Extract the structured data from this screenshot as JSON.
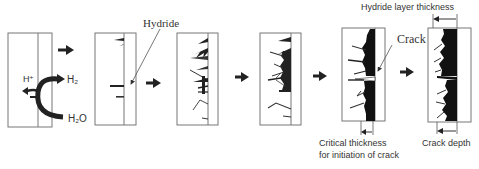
{
  "diagram": {
    "stages": [
      {
        "id": 1,
        "description": "Hydrogen uptake from water"
      },
      {
        "id": 2,
        "description": "Initial hydride precipitates"
      },
      {
        "id": 3,
        "description": "Hydride growth"
      },
      {
        "id": 4,
        "description": "Hydride layer forms"
      },
      {
        "id": 5,
        "description": "Crack initiates at critical thickness"
      },
      {
        "id": 6,
        "description": "Crack propagation"
      }
    ],
    "labels": {
      "h_plus": "H⁺",
      "h2": "H₂",
      "h2o": "H₂O",
      "hydride": "Hydride",
      "crack": "Crack",
      "hydride_layer_thickness": "Hydride layer thickness",
      "critical_thickness_line1": "Critical thickness",
      "critical_thickness_line2": "for initiation of crack",
      "crack_depth": "Crack depth"
    },
    "colors": {
      "line": "#777777",
      "ink": "#1a1a1a",
      "text": "#333333"
    }
  }
}
